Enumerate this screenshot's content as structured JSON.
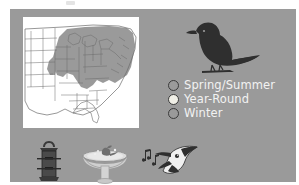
{
  "slide": {
    "background_color": "#ffffff",
    "panel_color": "#9a9a9a"
  },
  "map": {
    "name": "eastern-united-states-range-map",
    "background_color": "#ffffff",
    "outline_color": "#6b6b6b",
    "shaded_region_color": "#9a9a9a",
    "description": "Outline map of the eastern and central United States with the eastern and midwestern states shaded"
  },
  "bird": {
    "name": "perched-songbird-silhouette",
    "color": "#2f2f2f"
  },
  "legend": {
    "title": "",
    "items": [
      {
        "label": "Spring/Summer",
        "swatch_color": "#9a9a9a",
        "swatch_border_color": "#3a3a3a",
        "icon": "circle-icon"
      },
      {
        "label": "Year-Round",
        "swatch_color": "#f0efe6",
        "swatch_border_color": "#3a3a3a",
        "icon": "circle-icon"
      },
      {
        "label": "Winter",
        "swatch_color": "#9a9a9a",
        "swatch_border_color": "#3a3a3a",
        "icon": "circle-icon"
      }
    ],
    "text_color": "#f2f2f2"
  },
  "bottom_icons": [
    {
      "name": "bird-feeder-icon",
      "label": "Bird feeder",
      "color": "#4a4a4a"
    },
    {
      "name": "birdbath-icon",
      "label": "Birdbath",
      "color": "#d8d8d8"
    },
    {
      "name": "singing-bird-icon",
      "label": "Singing bird with music notes",
      "color": "#2f2f2f"
    }
  ]
}
